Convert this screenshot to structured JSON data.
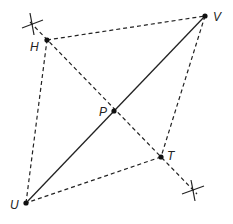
{
  "diagram": {
    "points": {
      "H": {
        "label": "H",
        "x": 47,
        "y": 40
      },
      "V": {
        "label": "V",
        "x": 205,
        "y": 16
      },
      "P": {
        "label": "P",
        "x": 114,
        "y": 111
      },
      "T": {
        "label": "T",
        "x": 161,
        "y": 157
      },
      "U": {
        "label": "U",
        "x": 26,
        "y": 203
      }
    },
    "solid_segments": [
      [
        "U",
        "V"
      ]
    ],
    "dashed_segments": [
      [
        "H",
        "V"
      ],
      [
        "V",
        "T"
      ],
      [
        "T",
        "U"
      ],
      [
        "U",
        "H"
      ],
      [
        "H",
        "T"
      ]
    ],
    "arc_marks": [
      {
        "x": 32,
        "y": 24
      },
      {
        "x": 193,
        "y": 191
      }
    ],
    "colors": {
      "line": "#222222",
      "background": "#ffffff"
    }
  }
}
